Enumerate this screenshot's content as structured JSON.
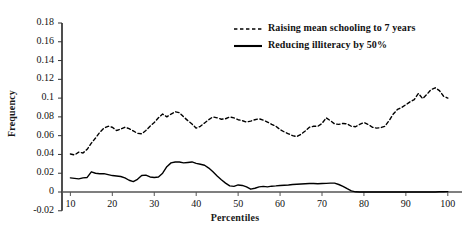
{
  "chart_data": {
    "type": "line",
    "title": "",
    "xlabel": "Percentiles",
    "ylabel": "Frequency",
    "xlim": [
      8,
      101
    ],
    "ylim": [
      -0.02,
      0.18
    ],
    "grid": false,
    "legend_position": "top-right",
    "xticks": [
      10,
      20,
      30,
      40,
      50,
      60,
      70,
      80,
      90,
      100
    ],
    "xtick_labels": [
      "10",
      "20",
      "30",
      "40",
      "50",
      "60",
      "70",
      "80",
      "90",
      "100"
    ],
    "yticks": [
      -0.02,
      0,
      0.02,
      0.04,
      0.06,
      0.08,
      0.1,
      0.12,
      0.14,
      0.16,
      0.18
    ],
    "ytick_labels": [
      "-0.02",
      "0",
      "0.02",
      "0.04",
      "0.06",
      "0.08",
      "0.1",
      "0.12",
      "0.14",
      "0.16",
      "0.18"
    ],
    "x": [
      10,
      11,
      12,
      13,
      14,
      15,
      16,
      17,
      18,
      19,
      20,
      21,
      22,
      23,
      24,
      25,
      26,
      27,
      28,
      29,
      30,
      31,
      32,
      33,
      34,
      35,
      36,
      37,
      38,
      39,
      40,
      41,
      42,
      43,
      44,
      45,
      46,
      47,
      48,
      49,
      50,
      51,
      52,
      53,
      54,
      55,
      56,
      57,
      58,
      59,
      60,
      61,
      62,
      63,
      64,
      65,
      66,
      67,
      68,
      69,
      70,
      71,
      72,
      73,
      74,
      75,
      76,
      77,
      78,
      79,
      80,
      81,
      82,
      83,
      84,
      85,
      86,
      87,
      88,
      89,
      90,
      91,
      92,
      93,
      94,
      95,
      96,
      97,
      98,
      99,
      100
    ],
    "series": [
      {
        "name": "Raising mean schooling to 7 years",
        "style": "dashed",
        "color": "#000000",
        "values": [
          0.0405,
          0.0395,
          0.0425,
          0.0415,
          0.0455,
          0.052,
          0.0575,
          0.0635,
          0.068,
          0.07,
          0.069,
          0.0655,
          0.067,
          0.069,
          0.0675,
          0.065,
          0.0625,
          0.062,
          0.0655,
          0.07,
          0.074,
          0.079,
          0.083,
          0.08,
          0.083,
          0.0855,
          0.0845,
          0.08,
          0.076,
          0.0725,
          0.068,
          0.07,
          0.0735,
          0.077,
          0.08,
          0.079,
          0.0775,
          0.078,
          0.08,
          0.079,
          0.077,
          0.076,
          0.0745,
          0.0755,
          0.077,
          0.078,
          0.0765,
          0.0745,
          0.072,
          0.07,
          0.0665,
          0.064,
          0.062,
          0.06,
          0.059,
          0.0615,
          0.065,
          0.069,
          0.07,
          0.07,
          0.073,
          0.079,
          0.076,
          0.0725,
          0.072,
          0.073,
          0.0725,
          0.07,
          0.0695,
          0.072,
          0.074,
          0.072,
          0.069,
          0.068,
          0.0685,
          0.07,
          0.076,
          0.083,
          0.088,
          0.09,
          0.093,
          0.096,
          0.0985,
          0.105,
          0.0995,
          0.104,
          0.109,
          0.111,
          0.108,
          0.102,
          0.1
        ],
        "linewidth": 1.4
      },
      {
        "name": "Reducing illiteracy by 50%",
        "style": "solid",
        "color": "#000000",
        "values": [
          0.015,
          0.0145,
          0.014,
          0.015,
          0.0155,
          0.0215,
          0.02,
          0.0195,
          0.0195,
          0.0185,
          0.0175,
          0.017,
          0.0165,
          0.015,
          0.0125,
          0.011,
          0.0135,
          0.0175,
          0.018,
          0.016,
          0.0155,
          0.016,
          0.02,
          0.027,
          0.031,
          0.032,
          0.032,
          0.031,
          0.0315,
          0.032,
          0.0305,
          0.0295,
          0.0285,
          0.0255,
          0.0215,
          0.017,
          0.013,
          0.0095,
          0.0065,
          0.006,
          0.0075,
          0.007,
          0.0055,
          0.003,
          0.004,
          0.0055,
          0.006,
          0.0055,
          0.0062,
          0.0065,
          0.007,
          0.0072,
          0.0075,
          0.008,
          0.0082,
          0.0085,
          0.0088,
          0.009,
          0.009,
          0.0088,
          0.009,
          0.0092,
          0.0094,
          0.0095,
          0.008,
          0.006,
          0.0035,
          0.0012,
          0.0002,
          0.0,
          0.0,
          0.0,
          0.0,
          0.0,
          0.0,
          0.0,
          0.0,
          0.0,
          0.0,
          0.0,
          0.0,
          0.0,
          0.0,
          0.0,
          0.0,
          0.0,
          0.0,
          0.0,
          0.0002,
          0.0003,
          0.0004
        ],
        "linewidth": 1.4
      }
    ],
    "legend": [
      {
        "label": "Raising mean schooling to 7 years",
        "style": "dashed"
      },
      {
        "label": "Reducing illiteracy by 50%",
        "style": "solid"
      }
    ]
  }
}
